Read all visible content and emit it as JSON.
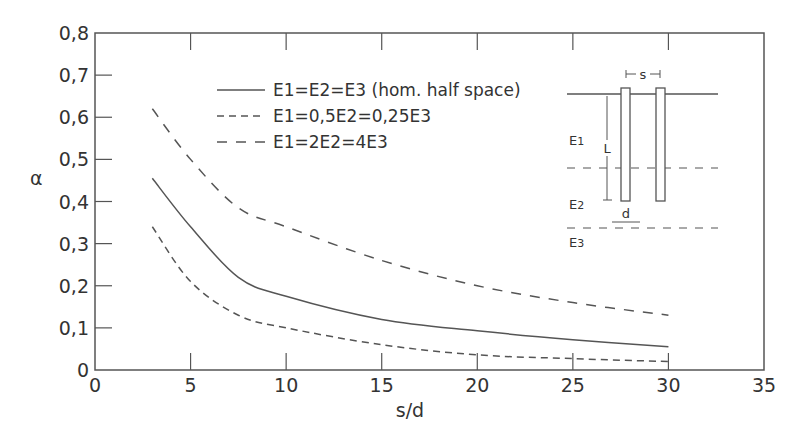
{
  "chart_data": {
    "type": "line",
    "title": "",
    "xlabel": "s/d",
    "ylabel": "α",
    "xlim": [
      0,
      35
    ],
    "ylim": [
      0,
      0.8
    ],
    "x_ticks": [
      0,
      5,
      10,
      15,
      20,
      25,
      30,
      35
    ],
    "x_tick_labels": [
      "0",
      "5",
      "10",
      "15",
      "20",
      "25",
      "30",
      "35"
    ],
    "y_ticks": [
      0,
      0.1,
      0.2,
      0.3,
      0.4,
      0.5,
      0.6,
      0.7,
      0.8
    ],
    "y_tick_labels": [
      "0",
      "0,1",
      "0,2",
      "0,3",
      "0,4",
      "0,5",
      "0,6",
      "0,7",
      "0,8"
    ],
    "grid": false,
    "legend_position": "upper center",
    "x": [
      3,
      5,
      7.5,
      10,
      15,
      20,
      25,
      30
    ],
    "series": [
      {
        "name": "E1=E2=E3 (hom. half space)",
        "style": "solid",
        "values": [
          0.455,
          0.34,
          0.22,
          0.175,
          0.12,
          0.093,
          0.072,
          0.055
        ]
      },
      {
        "name": "E1=0,5E2=0,25E3",
        "style": "short-dash",
        "values": [
          0.34,
          0.21,
          0.13,
          0.1,
          0.06,
          0.036,
          0.027,
          0.02
        ]
      },
      {
        "name": "E1=2E2=4E3",
        "style": "long-dash",
        "values": [
          0.62,
          0.5,
          0.385,
          0.34,
          0.26,
          0.2,
          0.16,
          0.13
        ]
      }
    ],
    "inset": {
      "description": "Two piles of diameter d and length L spaced s apart in layered soil E1, E2, E3",
      "labels": [
        "s",
        "L",
        "d",
        "E1",
        "E2",
        "E3"
      ]
    }
  },
  "axes": {
    "xlabel": "s/d",
    "ylabel": "α",
    "x_tick_labels": [
      "0",
      "5",
      "10",
      "15",
      "20",
      "25",
      "30",
      "35"
    ],
    "y_tick_labels": [
      "0",
      "0,1",
      "0,2",
      "0,3",
      "0,4",
      "0,5",
      "0,6",
      "0,7",
      "0,8"
    ]
  },
  "legend": [
    {
      "label": "E1=E2=E3  (hom. half space)",
      "style": "solid"
    },
    {
      "label": "E1=0,5E2=0,25E3",
      "style": "short-dash"
    },
    {
      "label": "E1=2E2=4E3",
      "style": "long-dash"
    }
  ],
  "inset": {
    "s": "s",
    "L": "L",
    "d": "d",
    "E1": "E",
    "E1_sub": "1",
    "E2": "E",
    "E2_sub": "2",
    "E3": "E",
    "E3_sub": "3"
  },
  "colors": {
    "line": "#555555",
    "text": "#333333",
    "background": "#ffffff"
  }
}
